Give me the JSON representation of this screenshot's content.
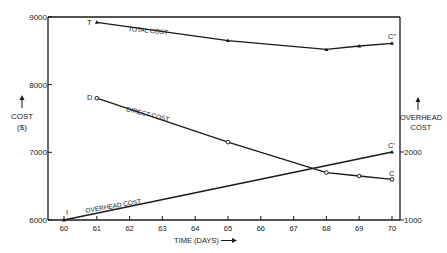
{
  "chart_data": {
    "type": "line",
    "title": "",
    "xlabel": "TIME (DAYS)",
    "ylabel_left": "COST ($)",
    "ylabel_right": "OVERHEAD COST",
    "x_ticks": [
      60,
      61,
      62,
      63,
      64,
      65,
      66,
      67,
      68,
      69,
      70
    ],
    "y_left_ticks": [
      6000,
      7000,
      8000,
      9000
    ],
    "y_right_ticks": [
      1000,
      2000
    ],
    "xlim": [
      59.5,
      70.25
    ],
    "ylim_left": [
      6000,
      9000
    ],
    "ylim_right": [
      1000,
      2000
    ],
    "grid": false,
    "series": [
      {
        "name": "TOTAL COST",
        "axis": "left",
        "marker": "triangle",
        "start_label": "T",
        "end_label": "C\"",
        "x": [
          61,
          65,
          68,
          69,
          70
        ],
        "values": [
          8920,
          8650,
          8520,
          8570,
          8610
        ]
      },
      {
        "name": "DIRECT COST",
        "axis": "left",
        "marker": "circle",
        "start_label": "D",
        "end_label": "C",
        "x": [
          61,
          65,
          68,
          69,
          70
        ],
        "values": [
          7800,
          7150,
          6700,
          6650,
          6600
        ]
      },
      {
        "name": "OVERHEAD COST",
        "axis": "right",
        "marker": "triangle",
        "start_label": "I",
        "end_label": "C'",
        "x": [
          60,
          70
        ],
        "values": [
          1000,
          2000
        ]
      }
    ]
  },
  "labels": {
    "cost": "COST",
    "cost_unit": "($)",
    "overhead_1": "OVERHEAD",
    "overhead_2": "COST",
    "time": "TIME (DAYS)",
    "total": "TOTAL COST",
    "direct": "DIRECT COST",
    "overhead_line": "OVERHEAD COST",
    "T": "T",
    "D": "D",
    "I": "I",
    "C": "C",
    "Cp": "C'",
    "Cpp": "C\""
  }
}
